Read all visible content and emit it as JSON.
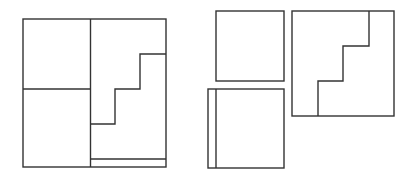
{
  "diagram": {
    "stroke_color": "#333333",
    "background": "#ffffff",
    "stroke_width": 1.4,
    "figures": [
      {
        "name": "composite-square",
        "shapes": [
          {
            "name": "outer-square",
            "type": "rect",
            "x": 23,
            "y": 19,
            "w": 143,
            "h": 148
          },
          {
            "name": "vertical-divider",
            "type": "line",
            "x1": 90.5,
            "y1": 19,
            "x2": 90.5,
            "y2": 167
          },
          {
            "name": "horizontal-divider-left",
            "type": "line",
            "x1": 23,
            "y1": 89,
            "x2": 90.5,
            "y2": 89
          },
          {
            "name": "staircase-line",
            "type": "polyline",
            "points": "90.5,124 115,124 115,89 140,89 140,54 166,54"
          },
          {
            "name": "bottom-strip-line",
            "type": "line",
            "x1": 90.5,
            "y1": 159,
            "x2": 166,
            "y2": 159
          }
        ]
      },
      {
        "name": "piece-square-top",
        "shapes": [
          {
            "name": "square-top",
            "type": "rect",
            "x": 216,
            "y": 11,
            "w": 68,
            "h": 70
          }
        ]
      },
      {
        "name": "piece-square-bottom",
        "shapes": [
          {
            "name": "square-bottom",
            "type": "rect",
            "x": 208,
            "y": 89,
            "w": 76,
            "h": 79
          },
          {
            "name": "strip-line",
            "type": "line",
            "x1": 216,
            "y1": 89,
            "x2": 216,
            "y2": 168
          }
        ]
      },
      {
        "name": "piece-staircase-square",
        "shapes": [
          {
            "name": "square-right",
            "type": "rect",
            "x": 292,
            "y": 11,
            "w": 102,
            "h": 105
          },
          {
            "name": "staircase-line-right",
            "type": "polyline",
            "points": "318,116 318,81 343,81 343,46 369,46 369,11"
          }
        ]
      }
    ]
  }
}
